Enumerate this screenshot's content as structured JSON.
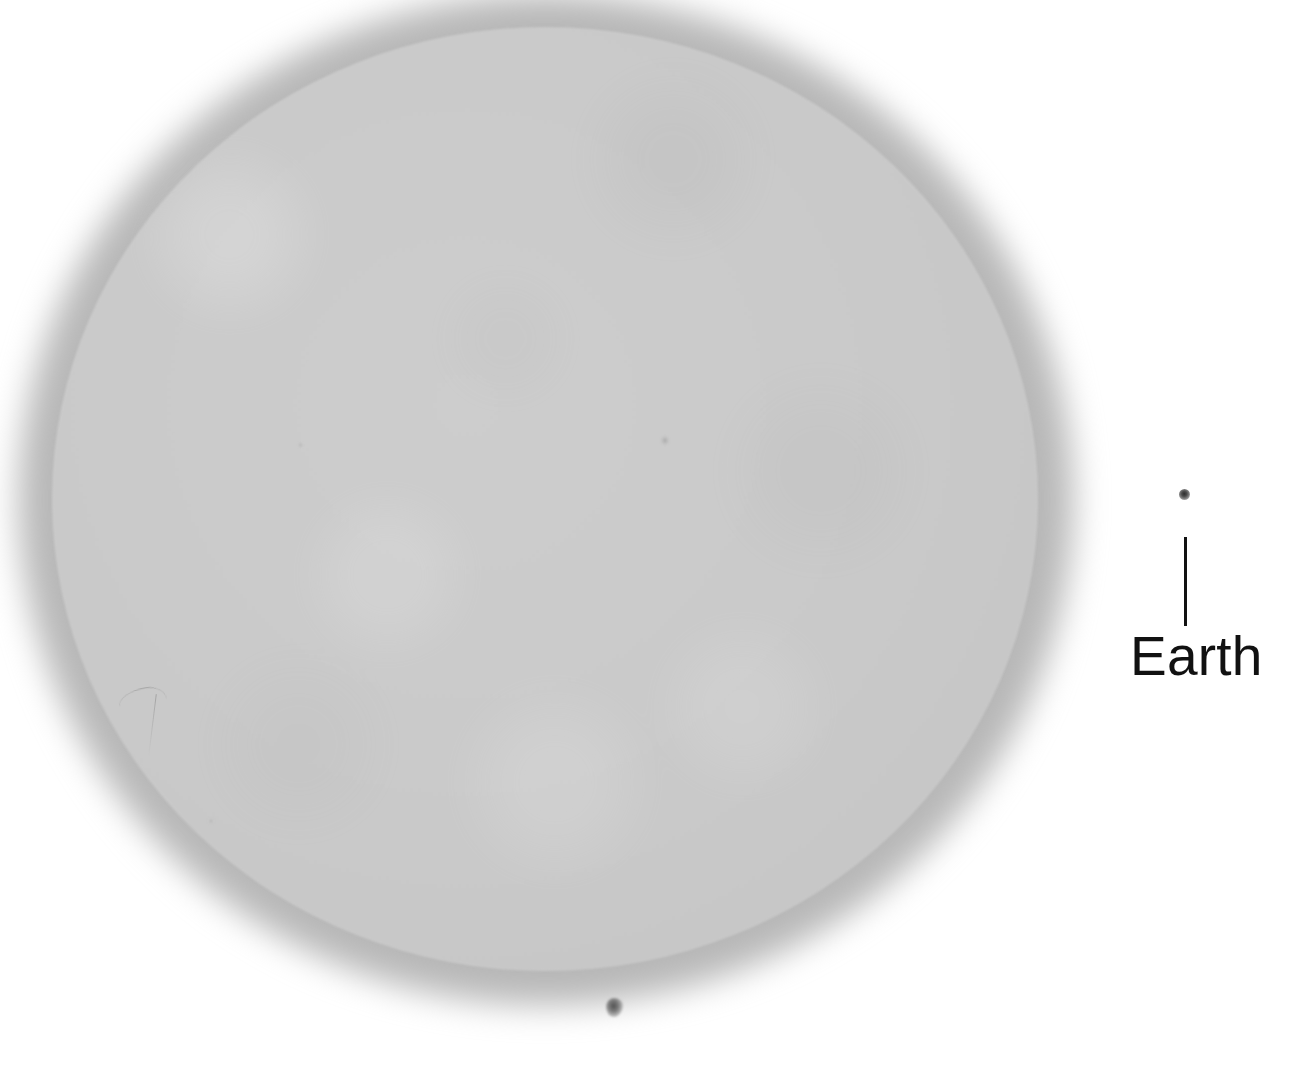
{
  "image": {
    "title": "Sun with Earth size comparison",
    "background_color": "#ffffff",
    "width": 1294,
    "height": 1071
  },
  "sun": {
    "name": "sun-disk",
    "description": "Full-disk solar photosphere image, grayscale",
    "fill_color": "#c9c9c9",
    "halo_color": "#aaaaaa",
    "center_x": 545,
    "center_y": 499,
    "radius_x": 493,
    "radius_y": 472
  },
  "annotations": {
    "earth": {
      "label": "Earth",
      "label_color": "#111111",
      "dot_color": "#2e2e2e",
      "leader_line_color": "#121212",
      "dot_x": 1184,
      "dot_y": 495,
      "dot_diameter": 11,
      "leader_top_y": 537,
      "leader_bottom_y": 626,
      "label_x": 1130,
      "label_y": 629
    }
  },
  "artifacts": [
    {
      "name": "sunspot-main",
      "x": 615,
      "y": 1008,
      "tone": "#464646"
    },
    {
      "name": "speck-a",
      "x": 665,
      "y": 440,
      "tone": "#8c8c8c"
    },
    {
      "name": "speck-b",
      "x": 300,
      "y": 445,
      "tone": "#969696"
    },
    {
      "name": "speck-c",
      "x": 211,
      "y": 821,
      "tone": "#9b9b9b"
    },
    {
      "name": "scratch-hairline",
      "x": 140,
      "y": 700,
      "tone": "#787878"
    }
  ]
}
